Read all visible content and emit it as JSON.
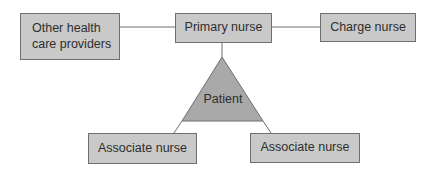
{
  "diagram": {
    "nodes": {
      "other_providers": {
        "line1": "Other health",
        "line2": "care providers"
      },
      "primary_nurse": {
        "label": "Primary nurse"
      },
      "charge_nurse": {
        "label": "Charge nurse"
      },
      "patient": {
        "label": "Patient"
      },
      "associate_left": {
        "label": "Associate nurse"
      },
      "associate_right": {
        "label": "Associate nurse"
      }
    },
    "edges": [
      {
        "from": "other_providers",
        "to": "primary_nurse"
      },
      {
        "from": "primary_nurse",
        "to": "charge_nurse"
      },
      {
        "from": "primary_nurse",
        "to": "patient"
      },
      {
        "from": "patient",
        "to": "associate_left"
      },
      {
        "from": "patient",
        "to": "associate_right"
      }
    ],
    "colors": {
      "box_fill": "#c9c9c9",
      "triangle_fill": "#a9a9a9",
      "stroke": "#6f6f6f",
      "text": "#2e2e2e"
    }
  }
}
